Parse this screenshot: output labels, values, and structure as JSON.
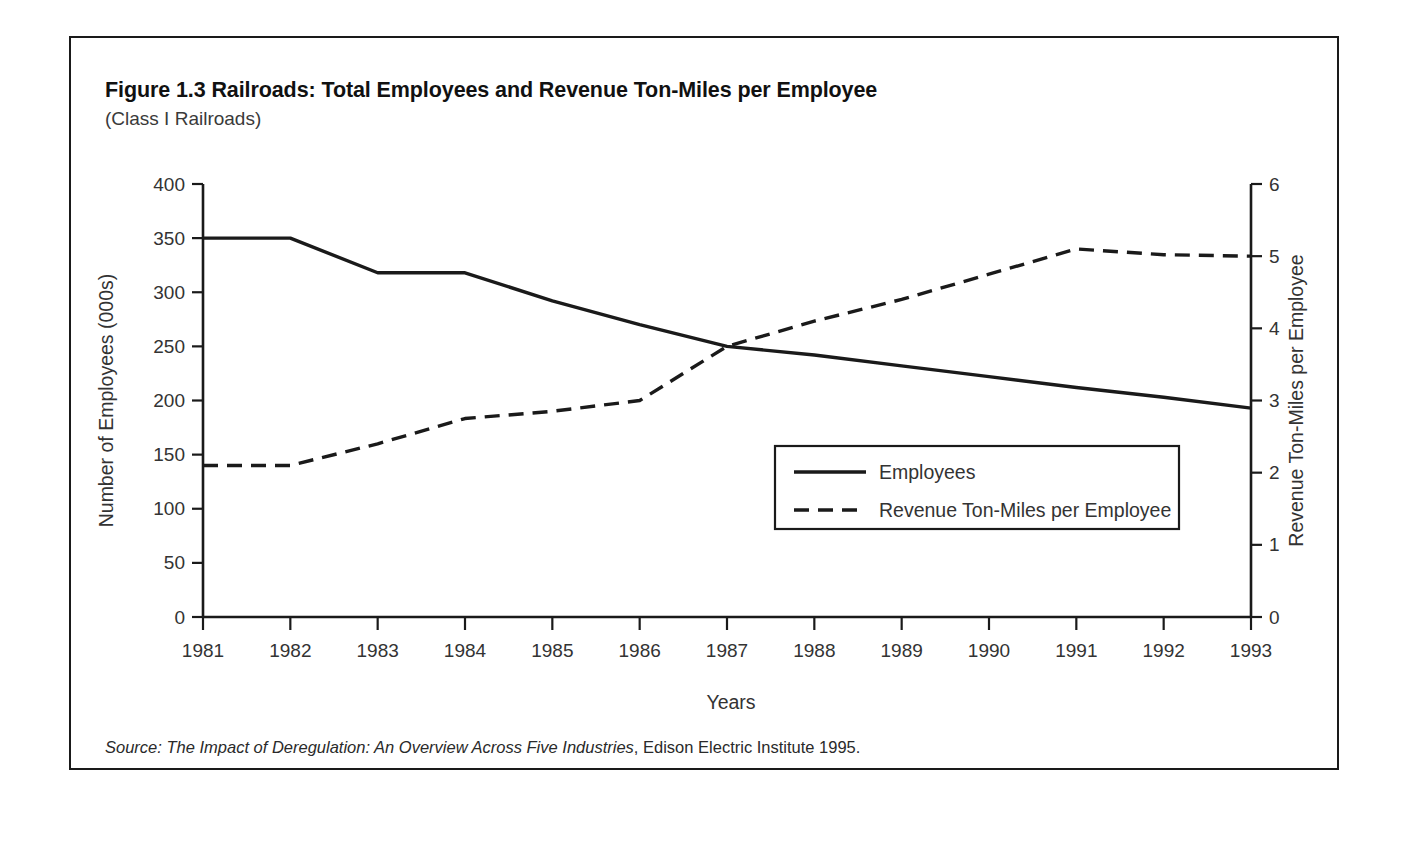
{
  "figure": {
    "title": "Figure 1.3 Railroads: Total Employees and Revenue Ton-Miles per Employee",
    "subtitle": "(Class I Railroads)",
    "source_italic": "Source: The Impact of Deregulation: An Overview Across Five Industries",
    "source_plain": ", Edison Electric Institute 1995."
  },
  "chart_data": {
    "type": "line",
    "title": "Figure 1.3 Railroads: Total Employees and Revenue Ton-Miles per Employee",
    "subtitle": "(Class I Railroads)",
    "xlabel": "Years",
    "ylabel": "Number of Employees (000s)",
    "ylabel_right": "Revenue Ton-Miles per Employee",
    "categories": [
      "1981",
      "1982",
      "1983",
      "1984",
      "1985",
      "1986",
      "1987",
      "1988",
      "1989",
      "1990",
      "1991",
      "1992",
      "1993"
    ],
    "x": [
      1981,
      1982,
      1983,
      1984,
      1985,
      1986,
      1987,
      1988,
      1989,
      1990,
      1991,
      1992,
      1993
    ],
    "ylim": [
      0,
      400
    ],
    "yticks": [
      0,
      50,
      100,
      150,
      200,
      250,
      300,
      350,
      400
    ],
    "ylim_right": [
      0,
      6
    ],
    "yticks_right": [
      0,
      1,
      2,
      3,
      4,
      5,
      6
    ],
    "grid": false,
    "legend_position": "lower right inside plot",
    "series": [
      {
        "name": "Employees",
        "axis": "left",
        "style": "solid",
        "color": "#1a1a1a",
        "values": [
          350,
          350,
          318,
          318,
          292,
          270,
          250,
          242,
          232,
          222,
          212,
          203,
          193
        ]
      },
      {
        "name": "Revenue Ton-Miles per Employee",
        "axis": "right",
        "style": "dashed",
        "color": "#1a1a1a",
        "values": [
          2.1,
          2.1,
          2.4,
          2.75,
          2.85,
          3.0,
          3.75,
          4.1,
          4.4,
          4.75,
          5.1,
          5.02,
          5.0
        ]
      }
    ]
  },
  "legend": {
    "items": [
      {
        "label": "Employees",
        "style": "solid"
      },
      {
        "label": "Revenue Ton-Miles per Employee",
        "style": "dashed"
      }
    ]
  }
}
